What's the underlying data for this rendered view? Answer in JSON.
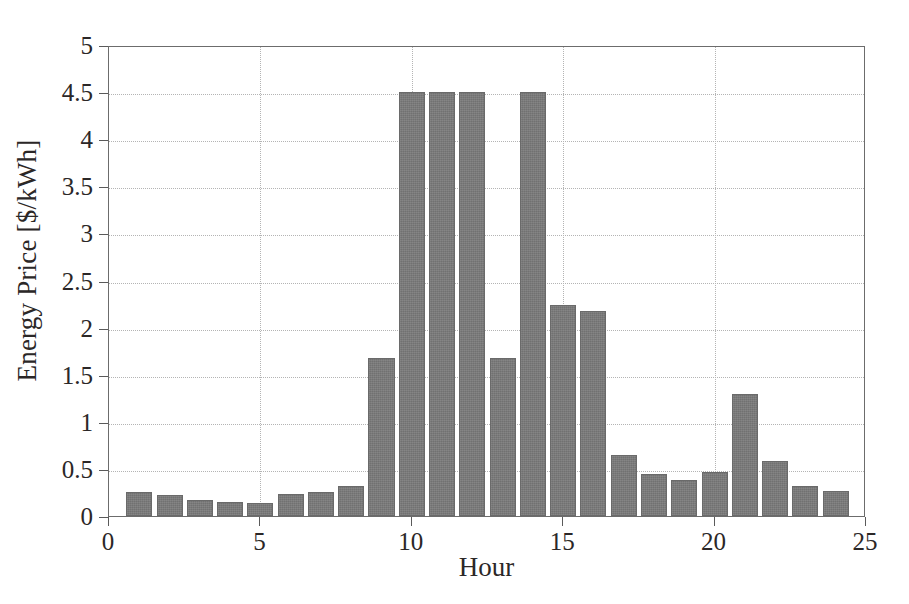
{
  "chart_data": {
    "type": "bar",
    "title": "",
    "xlabel": "Hour",
    "ylabel": "Energy Price [$/kWh]",
    "xlim": [
      0,
      25
    ],
    "ylim": [
      0,
      5
    ],
    "grid": true,
    "legend": null,
    "bar_color": "#7b7b7b",
    "bar_edge_color": "#6a6a6a",
    "axis_color": "#6c6c6c",
    "grid_color": "#b4b4b4",
    "xticks": [
      "0",
      "5",
      "10",
      "15",
      "20",
      "25"
    ],
    "xtick_values": [
      0,
      5,
      10,
      15,
      20,
      25
    ],
    "yticks": [
      "0",
      "0.5",
      "1",
      "1.5",
      "2",
      "2.5",
      "3",
      "3.5",
      "4",
      "4.5",
      "5"
    ],
    "ytick_values": [
      0,
      0.5,
      1,
      1.5,
      2,
      2.5,
      3,
      3.5,
      4,
      4.5,
      5
    ],
    "categories": [
      1,
      2,
      3,
      4,
      5,
      6,
      7,
      8,
      9,
      10,
      11,
      12,
      13,
      14,
      15,
      16,
      17,
      18,
      19,
      20,
      21,
      22,
      23,
      24
    ],
    "values": [
      0.26,
      0.22,
      0.17,
      0.15,
      0.14,
      0.23,
      0.26,
      0.32,
      1.68,
      4.5,
      4.5,
      4.5,
      1.68,
      4.5,
      2.24,
      2.18,
      0.65,
      0.45,
      0.38,
      0.47,
      1.3,
      0.58,
      0.32,
      0.27
    ],
    "bar_width": 0.86
  }
}
